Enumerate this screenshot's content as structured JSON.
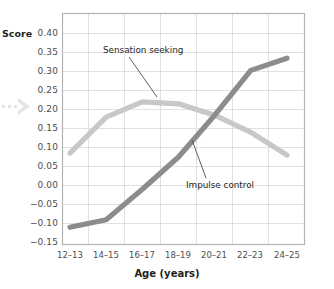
{
  "chart_data": {
    "type": "line",
    "title": "",
    "xlabel": "Age (years)",
    "ylabel": "Score",
    "categories": [
      "12–13",
      "14–15",
      "16–17",
      "18–19",
      "20–21",
      "22–23",
      "24–25"
    ],
    "ylim": [
      -0.15,
      0.4
    ],
    "ytick_labels": [
      "0.40",
      "0.35",
      "0.30",
      "0.25",
      "0.20",
      "0.15",
      "0.10",
      "0.05",
      "0.00",
      "−0.05",
      "−0.10",
      "−0.15"
    ],
    "ytick_values": [
      0.4,
      0.35,
      0.3,
      0.25,
      0.2,
      0.15,
      0.1,
      0.05,
      0.0,
      -0.05,
      -0.1,
      -0.15
    ],
    "grid": true,
    "legend_position": "inline-annotations",
    "series": [
      {
        "name": "Sensation seeking",
        "color": "#c8c8c8",
        "values": [
          0.085,
          0.18,
          0.22,
          0.215,
          0.185,
          0.14,
          0.08
        ]
      },
      {
        "name": "Impulse control",
        "color": "#8c8c8c",
        "values": [
          -0.11,
          -0.09,
          -0.01,
          0.075,
          0.185,
          0.303,
          0.335
        ]
      }
    ],
    "annotations": [
      {
        "text": "Sensation seeking",
        "series": "Sensation seeking"
      },
      {
        "text": "Impulse control",
        "series": "Impulse control"
      }
    ]
  },
  "axis": {
    "y_label": "Score",
    "x_label": "Age (years)"
  },
  "icons": {
    "margin_arrow": "dotted-arrow-right-icon"
  }
}
